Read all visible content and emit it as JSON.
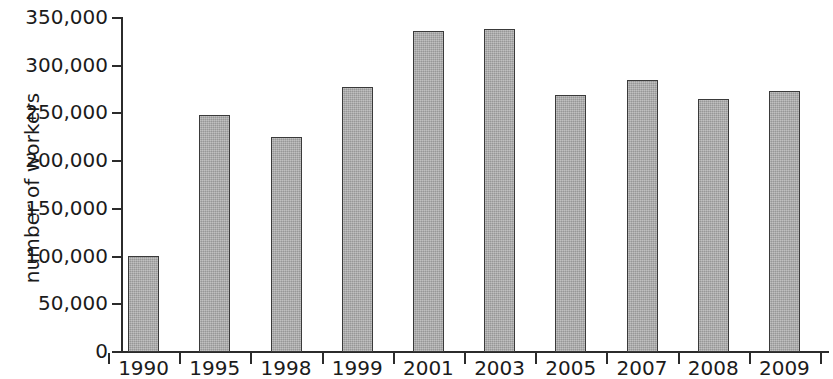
{
  "chart_data": {
    "type": "bar",
    "title": "",
    "subtitle": "",
    "xlabel": "",
    "ylabel": "number of workers",
    "categories": [
      "1990",
      "1995",
      "1998",
      "1999",
      "2001",
      "2003",
      "2005",
      "2007",
      "2008",
      "2009"
    ],
    "values": [
      101000,
      248000,
      225000,
      278000,
      336000,
      338000,
      269000,
      285000,
      265000,
      274000
    ],
    "ylim": [
      0,
      350000
    ],
    "y_ticks": [
      0,
      50000,
      100000,
      150000,
      200000,
      250000,
      300000,
      350000
    ],
    "y_tick_labels": [
      "0",
      "50,000",
      "100,000",
      "150,000",
      "200,000",
      "250,000",
      "300,000",
      "350,000"
    ],
    "grid": false,
    "legend": null,
    "legend_position": "none",
    "series": [
      {
        "name": "number of workers",
        "values": [
          101000,
          248000,
          225000,
          278000,
          336000,
          338000,
          269000,
          285000,
          265000,
          274000
        ]
      }
    ],
    "colors": {
      "bar_fill": "#a9a9a9",
      "bar_border": "#3a3a3a",
      "axis": "#2b2b2b",
      "text": "#1b1b1b",
      "background": "#ffffff"
    }
  }
}
